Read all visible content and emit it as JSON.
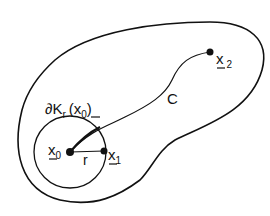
{
  "diagram": {
    "type": "region-with-ball-and-curve",
    "labels": {
      "boundary_ball": "∂K",
      "boundary_sub": "r",
      "boundary_arg_open": "(",
      "boundary_arg_x": "x",
      "boundary_arg_sub": "0",
      "boundary_arg_close": ")",
      "x0": "x",
      "x0_sub": "0",
      "x1": "x",
      "x1_sub": "1",
      "x2": "x",
      "x2_sub": "2",
      "radius": "r",
      "curve": "C"
    },
    "colors": {
      "stroke": "#111111",
      "background": "#ffffff"
    }
  }
}
